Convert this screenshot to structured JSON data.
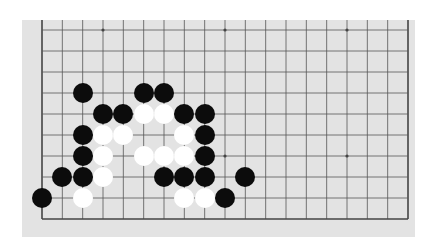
{
  "board": {
    "background": "#e3e3e3",
    "line_color": "#555555",
    "edge_color": "#444444",
    "columns": 19,
    "visible_rows": 10,
    "col_x": [
      42,
      62.33,
      82.67,
      103,
      123.33,
      143.67,
      164,
      184.33,
      204.67,
      225,
      245.33,
      265.67,
      286,
      306.33,
      326.67,
      347,
      367.33,
      387.67,
      408
    ],
    "row_y": [
      30,
      51,
      72,
      93,
      114,
      135,
      156,
      177,
      198,
      219
    ],
    "edges": {
      "left": true,
      "right": true,
      "bottom": true,
      "top": false
    },
    "star_points": [
      [
        3,
        0
      ],
      [
        9,
        0
      ],
      [
        15,
        0
      ],
      [
        9,
        6
      ],
      [
        15,
        6
      ]
    ],
    "stones": [
      {
        "c": 2,
        "r": 3,
        "color": "black"
      },
      {
        "c": 5,
        "r": 3,
        "color": "black"
      },
      {
        "c": 6,
        "r": 3,
        "color": "black"
      },
      {
        "c": 3,
        "r": 4,
        "color": "black"
      },
      {
        "c": 4,
        "r": 4,
        "color": "black"
      },
      {
        "c": 5,
        "r": 4,
        "color": "white"
      },
      {
        "c": 6,
        "r": 4,
        "color": "white"
      },
      {
        "c": 7,
        "r": 4,
        "color": "black"
      },
      {
        "c": 8,
        "r": 4,
        "color": "black"
      },
      {
        "c": 2,
        "r": 5,
        "color": "black"
      },
      {
        "c": 3,
        "r": 5,
        "color": "white"
      },
      {
        "c": 4,
        "r": 5,
        "color": "white"
      },
      {
        "c": 7,
        "r": 5,
        "color": "white"
      },
      {
        "c": 8,
        "r": 5,
        "color": "black"
      },
      {
        "c": 2,
        "r": 6,
        "color": "black"
      },
      {
        "c": 3,
        "r": 6,
        "color": "white"
      },
      {
        "c": 5,
        "r": 6,
        "color": "white"
      },
      {
        "c": 6,
        "r": 6,
        "color": "white"
      },
      {
        "c": 7,
        "r": 6,
        "color": "white"
      },
      {
        "c": 8,
        "r": 6,
        "color": "black"
      },
      {
        "c": 1,
        "r": 7,
        "color": "black"
      },
      {
        "c": 2,
        "r": 7,
        "color": "black"
      },
      {
        "c": 3,
        "r": 7,
        "color": "white"
      },
      {
        "c": 6,
        "r": 7,
        "color": "black"
      },
      {
        "c": 7,
        "r": 7,
        "color": "black"
      },
      {
        "c": 8,
        "r": 7,
        "color": "black"
      },
      {
        "c": 10,
        "r": 7,
        "color": "black"
      },
      {
        "c": 0,
        "r": 8,
        "color": "black"
      },
      {
        "c": 2,
        "r": 8,
        "color": "white"
      },
      {
        "c": 7,
        "r": 8,
        "color": "white"
      },
      {
        "c": 8,
        "r": 8,
        "color": "white"
      },
      {
        "c": 9,
        "r": 8,
        "color": "black"
      }
    ]
  }
}
